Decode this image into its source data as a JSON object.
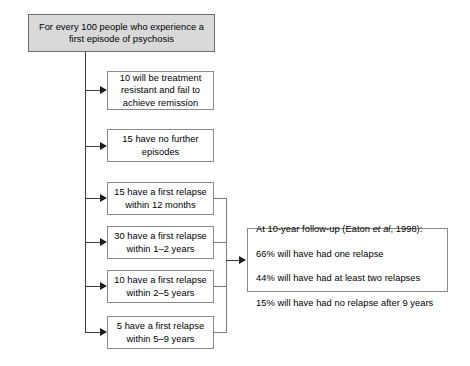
{
  "diagram": {
    "title_box": {
      "text": "For every 100 people who experience a\nfirst episode of psychosis"
    },
    "outcome_boxes": [
      {
        "id": "treatment-resistant",
        "text": "10 will be treatment\nresistant and fail to\nachieve remission"
      },
      {
        "id": "no-further-episodes",
        "text": "15 have no further\nepisodes"
      },
      {
        "id": "relapse-12-months",
        "text": "15 have a first relapse\nwithin 12 months"
      },
      {
        "id": "relapse-1-2-years",
        "text": "30 have a first relapse\nwithin 1–2 years"
      },
      {
        "id": "relapse-2-5-years",
        "text": "10 have a first relapse\nwithin 2–5 years"
      },
      {
        "id": "relapse-5-9-years",
        "text": "5 have a first relapse\nwithin 5–9 years"
      }
    ],
    "followup_box": {
      "line1_prefix": "At 10-year follow-up (Eaton ",
      "line1_italic": "et al",
      "line1_suffix": ", 1998):",
      "line2": "66% will have had one relapse",
      "line3": "44% will have had at least two relapses",
      "line4": "15% will have had no relapse after 9 years"
    },
    "colors": {
      "header_fill": "#d9d9d9",
      "box_fill": "#ffffff",
      "border": "#8a8a8a",
      "connector": "#3a3a3a",
      "text": "#000000",
      "background": "#ffffff"
    }
  }
}
